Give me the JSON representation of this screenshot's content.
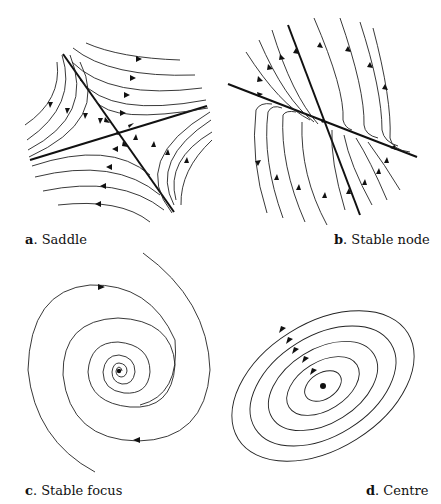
{
  "figure": {
    "panels": [
      {
        "letter": "a",
        "sep": ". ",
        "title": "Saddle"
      },
      {
        "letter": "b",
        "sep": ". ",
        "title": "Stable node"
      },
      {
        "letter": "c",
        "sep": ". ",
        "title": "Stable focus"
      },
      {
        "letter": "d",
        "sep": ". ",
        "title": "Centre"
      }
    ]
  }
}
